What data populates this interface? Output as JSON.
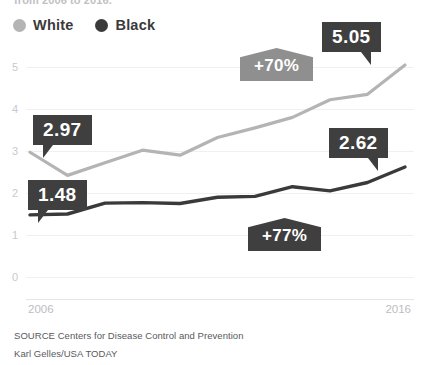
{
  "headline": "from 2006 to 2016.",
  "legend": {
    "position": "top-left",
    "items": [
      {
        "label": "White",
        "color": "#b4b4b4",
        "marker": "legend-dot-white"
      },
      {
        "label": "Black",
        "color": "#3a3a3a",
        "marker": "legend-dot-black"
      }
    ]
  },
  "footer": {
    "source": "SOURCE Centers for Disease Control and Prevention",
    "credit": "Karl Gelles/USA TODAY"
  },
  "callouts": [
    {
      "name": "white-start-value",
      "text": "2.97",
      "color": "#3f3f3f"
    },
    {
      "name": "black-start-value",
      "text": "1.48",
      "color": "#3f3f3f"
    },
    {
      "name": "white-end-value",
      "text": "5.05",
      "color": "#3f3f3f"
    },
    {
      "name": "black-end-value",
      "text": "2.62",
      "color": "#3f3f3f"
    }
  ],
  "badges": [
    {
      "name": "white-change-badge",
      "text": "+70%",
      "color": "#8f8f8f"
    },
    {
      "name": "black-change-badge",
      "text": "+77%",
      "color": "#3f3f3f"
    }
  ],
  "chart_data": {
    "type": "line",
    "title": "",
    "xlabel": "",
    "ylabel": "",
    "x": [
      2006,
      2007,
      2008,
      2009,
      2010,
      2011,
      2012,
      2013,
      2014,
      2015,
      2016
    ],
    "xtick_labels": [
      "2006",
      "2016"
    ],
    "ytick_labels": [
      "0",
      "1",
      "2",
      "3",
      "4",
      "5"
    ],
    "yticks": [
      0,
      1,
      2,
      3,
      4,
      5
    ],
    "ylim": [
      0,
      5.4
    ],
    "xlim": [
      2006,
      2016
    ],
    "grid": true,
    "legend_position": "top-left",
    "series": [
      {
        "name": "White",
        "color": "#b4b4b4",
        "values": [
          2.97,
          2.42,
          2.72,
          3.02,
          2.9,
          3.32,
          3.55,
          3.8,
          4.22,
          4.35,
          5.05
        ],
        "start_value": 2.97,
        "end_value": 5.05,
        "percent_change": "+70%"
      },
      {
        "name": "Black",
        "color": "#3a3a3a",
        "values": [
          1.48,
          1.5,
          1.76,
          1.77,
          1.75,
          1.9,
          1.92,
          2.15,
          2.05,
          2.25,
          2.62
        ],
        "start_value": 1.48,
        "end_value": 2.62,
        "percent_change": "+77%"
      }
    ]
  }
}
